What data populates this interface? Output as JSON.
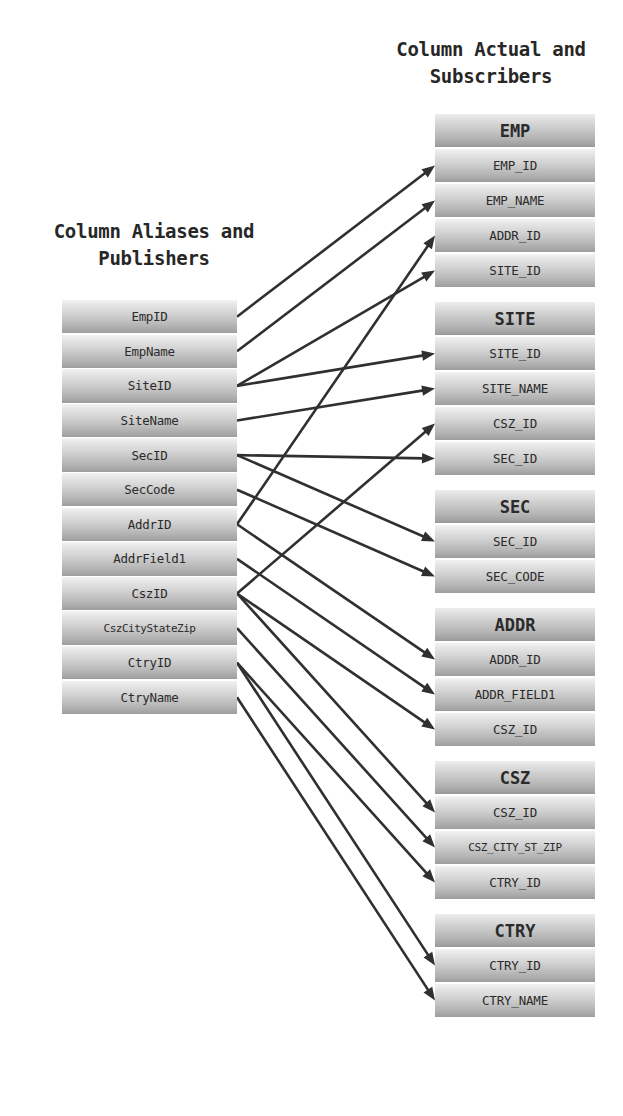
{
  "diagram": {
    "title_left": "Column Aliases and\nPublishers",
    "title_right": "Column Actual and\nSubscribers",
    "stroke_color": "#303030",
    "left_column": {
      "x": 62,
      "y": 300,
      "width": 175,
      "row_height": 34.6,
      "items": [
        {
          "label": "EmpID",
          "small": false
        },
        {
          "label": "EmpName",
          "small": false
        },
        {
          "label": "SiteID",
          "small": false
        },
        {
          "label": "SiteName",
          "small": false
        },
        {
          "label": "SecID",
          "small": false
        },
        {
          "label": "SecCode",
          "small": false
        },
        {
          "label": "AddrID",
          "small": false
        },
        {
          "label": "AddrField1",
          "small": false
        },
        {
          "label": "CszID",
          "small": false
        },
        {
          "label": "CszCityStateZip",
          "small": true
        },
        {
          "label": "CtryID",
          "small": false
        },
        {
          "label": "CtryName",
          "small": false
        }
      ]
    },
    "right_column": {
      "x": 435,
      "width": 160,
      "row_height": 35,
      "group_gap": 13,
      "start_y": 114,
      "groups": [
        {
          "name": "EMP",
          "fields": [
            "EMP_ID",
            "EMP_NAME",
            "ADDR_ID",
            "SITE_ID"
          ]
        },
        {
          "name": "SITE",
          "fields": [
            "SITE_ID",
            "SITE_NAME",
            "CSZ_ID",
            "SEC_ID"
          ]
        },
        {
          "name": "SEC",
          "fields": [
            "SEC_ID",
            "SEC_CODE"
          ]
        },
        {
          "name": "ADDR",
          "fields": [
            "ADDR_ID",
            "ADDR_FIELD1",
            "CSZ_ID"
          ]
        },
        {
          "name": "CSZ",
          "fields": [
            "CSZ_ID",
            "CSZ_CITY_ST_ZIP",
            "CTRY_ID"
          ]
        },
        {
          "name": "CTRY",
          "fields": [
            "CTRY_ID",
            "CTRY_NAME"
          ]
        }
      ]
    },
    "connections": [
      {
        "from": "EmpID",
        "to_group": "EMP",
        "to_field": "EMP_ID"
      },
      {
        "from": "EmpName",
        "to_group": "EMP",
        "to_field": "EMP_NAME"
      },
      {
        "from": "SiteID",
        "to_group": "EMP",
        "to_field": "SITE_ID"
      },
      {
        "from": "SiteID",
        "to_group": "SITE",
        "to_field": "SITE_ID"
      },
      {
        "from": "SiteName",
        "to_group": "SITE",
        "to_field": "SITE_NAME"
      },
      {
        "from": "SecID",
        "to_group": "SITE",
        "to_field": "SEC_ID"
      },
      {
        "from": "SecID",
        "to_group": "SEC",
        "to_field": "SEC_ID"
      },
      {
        "from": "SecCode",
        "to_group": "SEC",
        "to_field": "SEC_CODE"
      },
      {
        "from": "AddrID",
        "to_group": "EMP",
        "to_field": "ADDR_ID"
      },
      {
        "from": "AddrID",
        "to_group": "ADDR",
        "to_field": "ADDR_ID"
      },
      {
        "from": "AddrField1",
        "to_group": "ADDR",
        "to_field": "ADDR_FIELD1"
      },
      {
        "from": "CszID",
        "to_group": "SITE",
        "to_field": "CSZ_ID"
      },
      {
        "from": "CszID",
        "to_group": "ADDR",
        "to_field": "CSZ_ID"
      },
      {
        "from": "CszID",
        "to_group": "CSZ",
        "to_field": "CSZ_ID"
      },
      {
        "from": "CszCityStateZip",
        "to_group": "CSZ",
        "to_field": "CSZ_CITY_ST_ZIP"
      },
      {
        "from": "CtryID",
        "to_group": "CSZ",
        "to_field": "CTRY_ID"
      },
      {
        "from": "CtryID",
        "to_group": "CTRY",
        "to_field": "CTRY_ID"
      },
      {
        "from": "CtryName",
        "to_group": "CTRY",
        "to_field": "CTRY_NAME"
      }
    ]
  }
}
